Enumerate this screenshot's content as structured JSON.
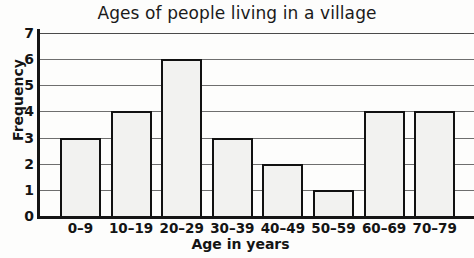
{
  "chart_data": {
    "type": "bar",
    "title": "Ages of people living in a village",
    "xlabel": "Age in years",
    "ylabel": "Frequency",
    "categories": [
      "0–9",
      "10–19",
      "20–29",
      "30–39",
      "40–49",
      "50–59",
      "60–69",
      "70–79"
    ],
    "values": [
      3,
      4,
      6,
      3,
      2,
      1,
      4,
      4
    ],
    "ylim": [
      0,
      7
    ],
    "yticks": [
      0,
      1,
      2,
      3,
      4,
      5,
      6,
      7
    ],
    "ytick_labels": [
      "0",
      "1",
      "2",
      "3",
      "4",
      "5",
      "6",
      "7"
    ],
    "grid": "horizontal",
    "legend": "none",
    "bar_fill_color": "#f2f2f0",
    "bar_edge_color": "#111111",
    "gridline_color": "#6e6e6e",
    "axis_color": "#151515",
    "text_color": "#141414"
  }
}
